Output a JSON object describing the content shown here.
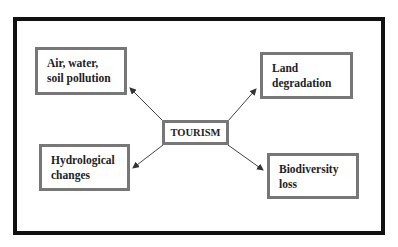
{
  "diagram": {
    "center": {
      "label": "TOURISM"
    },
    "impacts": [
      {
        "id": "air",
        "lines": [
          "Air, water,",
          "soil pollution"
        ]
      },
      {
        "id": "land",
        "lines": [
          "Land",
          "degradation"
        ]
      },
      {
        "id": "hydro",
        "lines": [
          "Hydrological",
          "changes"
        ]
      },
      {
        "id": "bio",
        "lines": [
          "Biodiversity",
          "loss"
        ]
      }
    ],
    "edges": [
      {
        "from": "TOURISM",
        "to": "air"
      },
      {
        "from": "TOURISM",
        "to": "land"
      },
      {
        "from": "TOURISM",
        "to": "hydro"
      },
      {
        "from": "TOURISM",
        "to": "bio"
      }
    ]
  }
}
